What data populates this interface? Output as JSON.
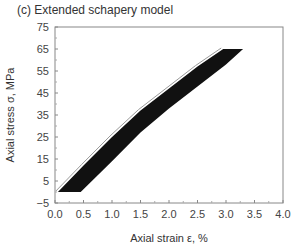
{
  "chart_data": {
    "type": "area",
    "title": "(c) Extended schapery model",
    "xlabel": "Axial strain ε, %",
    "ylabel": "Axial stress σ, MPa",
    "xlim": [
      0.0,
      4.0
    ],
    "ylim": [
      -5,
      75
    ],
    "x_ticks": [
      "0.0",
      "0.5",
      "1.0",
      "1.5",
      "2.0",
      "2.5",
      "3.0",
      "3.5",
      "4.0"
    ],
    "y_ticks": [
      "75",
      "65",
      "55",
      "45",
      "35",
      "25",
      "15",
      "5",
      "−5"
    ],
    "grid": false,
    "legend": null,
    "series": [
      {
        "name": "band upper-left edge (model envelope)",
        "x": [
          0.05,
          0.5,
          1.0,
          1.5,
          2.0,
          2.5,
          2.95
        ],
        "y": [
          0,
          12,
          25,
          37,
          47,
          57,
          65
        ]
      },
      {
        "name": "band lower-right edge (model envelope)",
        "x": [
          0.45,
          1.0,
          1.5,
          2.0,
          2.5,
          3.0,
          3.3
        ],
        "y": [
          0,
          14,
          27,
          38,
          48,
          58,
          65
        ]
      }
    ],
    "color": "#111111"
  }
}
